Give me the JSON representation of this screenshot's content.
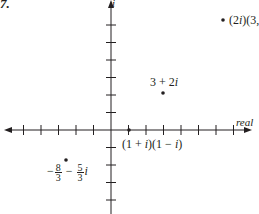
{
  "figure": {
    "problem_number": "7.",
    "axes": {
      "horizontal_label": "real",
      "vertical_label": "i",
      "origin_px": [
        111,
        130
      ],
      "tick_spacing_px": 17.5,
      "x_ticks": [
        -5,
        -4,
        -3,
        -2,
        -1,
        1,
        2,
        3,
        4,
        5,
        6,
        7
      ],
      "y_ticks": [
        -4,
        -3,
        -2,
        -1,
        1,
        2,
        3,
        4,
        5,
        6
      ]
    },
    "points": [
      {
        "id": "p1",
        "label_parts": {
          "a": "(2",
          "b": "i",
          "c": ")(3, −",
          "num": "5",
          "den": "2",
          "d": "i",
          "e": ")"
        },
        "px": [
          223,
          20
        ]
      },
      {
        "id": "p2",
        "label_parts": {
          "a": "3 + 2",
          "b": "i"
        },
        "px": [
          163,
          93
        ]
      },
      {
        "id": "p3",
        "label_parts": {
          "a": "(1 + ",
          "b": "i",
          "c": ")(1 − ",
          "d": "i",
          "e": ")"
        },
        "px": [
          129,
          130
        ]
      },
      {
        "id": "p4",
        "label_parts": {
          "sign": "−",
          "num1": "8",
          "den1": "3",
          "mid": " − ",
          "num2": "5",
          "den2": "3",
          "d": "i"
        },
        "px": [
          66,
          160
        ]
      }
    ],
    "colors": {
      "ink": "#231f20",
      "axis": "#231f20",
      "point": "#231f20",
      "background": "#ffffff"
    }
  }
}
